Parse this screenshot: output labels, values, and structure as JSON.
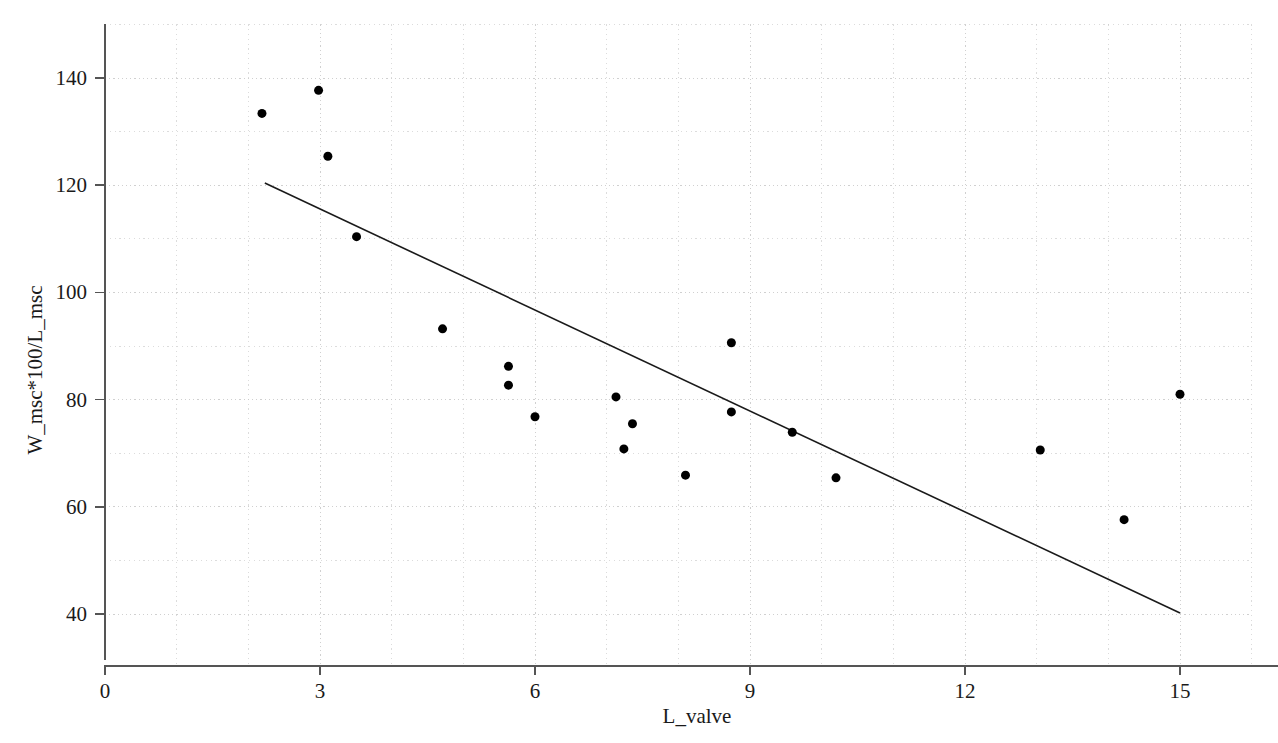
{
  "chart_data": {
    "type": "scatter",
    "title": "",
    "xlabel": "L_valve",
    "ylabel": "W_msc*100/L_msc",
    "xlim": [
      0,
      16.0
    ],
    "ylim": [
      35.0,
      150.0
    ],
    "grid": true,
    "legend": false,
    "x_major_ticks": [
      0,
      3,
      6,
      9,
      12,
      15
    ],
    "x_tick_labels": [
      "0",
      "3",
      "6",
      "9",
      "12",
      "15"
    ],
    "x_minor_step": 1,
    "y_major_ticks": [
      40,
      60,
      80,
      100,
      120,
      140
    ],
    "y_tick_labels": [
      "40",
      "60",
      "80",
      "100",
      "120",
      "140"
    ],
    "y_minor_ticks": [
      50,
      70,
      90,
      110,
      130,
      150
    ],
    "marker": "filled-circle",
    "marker_color": "#000000",
    "marker_size": 9,
    "points": [
      {
        "x": 2.19,
        "y": 133.4
      },
      {
        "x": 2.98,
        "y": 137.7
      },
      {
        "x": 3.11,
        "y": 125.4
      },
      {
        "x": 3.51,
        "y": 110.4
      },
      {
        "x": 4.71,
        "y": 93.2
      },
      {
        "x": 5.63,
        "y": 86.2
      },
      {
        "x": 5.63,
        "y": 82.7
      },
      {
        "x": 6.0,
        "y": 76.8
      },
      {
        "x": 7.13,
        "y": 80.5
      },
      {
        "x": 7.36,
        "y": 75.5
      },
      {
        "x": 7.24,
        "y": 70.8
      },
      {
        "x": 8.1,
        "y": 65.9
      },
      {
        "x": 8.74,
        "y": 90.6
      },
      {
        "x": 8.74,
        "y": 77.7
      },
      {
        "x": 9.59,
        "y": 73.9
      },
      {
        "x": 10.2,
        "y": 65.4
      },
      {
        "x": 13.05,
        "y": 70.6
      },
      {
        "x": 14.22,
        "y": 57.6
      },
      {
        "x": 15.0,
        "y": 81.0
      }
    ],
    "trend_line": {
      "name": "fitted-regression-line",
      "color": "#1a1a1a",
      "width": 1.6,
      "x_start": 2.23,
      "y_start": 120.4,
      "x_end": 15.0,
      "y_end": 40.2
    },
    "colors": {
      "axis": "#555555",
      "grid": "#c8c8c8",
      "marker": "#000000",
      "text": "#1a1a1a",
      "background": "#ffffff"
    }
  }
}
